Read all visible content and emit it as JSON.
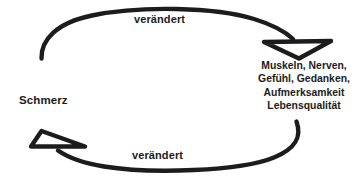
{
  "diagram": {
    "background_color": "#ffffff",
    "ink_color": "#1c1c1c",
    "nodes": {
      "pain": {
        "label": "Schmerz"
      },
      "effects": {
        "lines": [
          "Muskeln, Nerven,",
          "Gefühl, Gedanken,",
          "Aufmerksamkeit",
          "Lebensqualität"
        ]
      }
    },
    "edges": [
      {
        "id": "pain-to-effects",
        "label": "verändert",
        "from": "Schmerz",
        "to": "Muskeln, Nerven, Gefühl, Gedanken, Aufmerksamkeit, Lebensqualität",
        "direction": "left-to-right",
        "arrowhead": "open-hand-drawn-arrowhead",
        "position": "top"
      },
      {
        "id": "effects-to-pain",
        "label": "verändert",
        "from": "Muskeln, Nerven, Gefühl, Gedanken, Aufmerksamkeit, Lebensqualität",
        "to": "Schmerz",
        "direction": "right-to-left",
        "arrowhead": "open-hand-drawn-arrowhead",
        "position": "bottom"
      }
    ]
  }
}
